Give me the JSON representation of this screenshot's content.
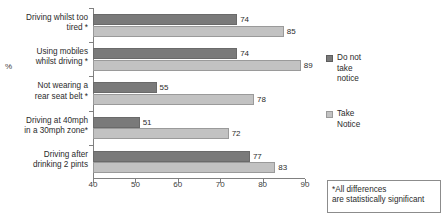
{
  "chart_data": {
    "type": "bar",
    "orientation": "horizontal",
    "title": "",
    "xlabel": "",
    "ylabel": "%",
    "xlim": [
      40,
      90
    ],
    "xticks": [
      40,
      50,
      60,
      70,
      80,
      90
    ],
    "grid": false,
    "legend_position": "right",
    "categories": [
      "Driving whilst too tired *",
      "Using mobiles whilst driving *",
      "Not wearing a rear seat belt *",
      "Driving at 40mph in a 30mph zone*",
      "Driving after drinking 2 pints"
    ],
    "category_lines": [
      [
        "Driving whilst too",
        "tired *"
      ],
      [
        "Using mobiles",
        "whilst driving *"
      ],
      [
        "Not wearing a",
        "rear seat belt *"
      ],
      [
        "Driving at 40mph",
        "in a 30mph zone*"
      ],
      [
        "Driving after",
        "drinking 2 pints"
      ]
    ],
    "series": [
      {
        "name": "Do not take notice",
        "color": "#7a7a7a",
        "values": [
          74,
          74,
          55,
          51,
          77
        ]
      },
      {
        "name": "Take Notice",
        "color": "#c2c2c2",
        "values": [
          85,
          89,
          78,
          72,
          83
        ]
      }
    ],
    "annotation": "*All differences are statistically significant"
  },
  "axis": {
    "percent_label": "%",
    "tick_labels": [
      "40",
      "50",
      "60",
      "70",
      "80",
      "90"
    ]
  },
  "legend": {
    "entries": [
      {
        "label": "Do not take notice",
        "lines": [
          "Do not",
          "take",
          "notice"
        ],
        "swatch": "dark"
      },
      {
        "label": "Take Notice",
        "lines": [
          "Take",
          "Notice"
        ],
        "swatch": "light"
      }
    ]
  },
  "note": {
    "lines": [
      "*All  differences",
      "are statistically significant"
    ]
  }
}
